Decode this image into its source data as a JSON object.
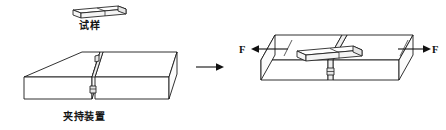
{
  "figure": {
    "type": "technical-line-diagram",
    "width": 446,
    "height": 130,
    "background_color": "#ffffff",
    "line_color": "#1a1a1a"
  },
  "labels": {
    "specimen": "试样",
    "clamping_device": "夹持装置",
    "force_left": "F",
    "force_right": "F"
  },
  "left_panel": {
    "name": "exploded-view",
    "parts": [
      {
        "id": "specimen-bar",
        "label": "试样"
      },
      {
        "id": "clamp-block-left",
        "label": ""
      },
      {
        "id": "clamp-block-right",
        "label": ""
      }
    ],
    "caption": "夹持装置"
  },
  "transition": {
    "name": "process-arrow",
    "direction": "right",
    "glyph": "→"
  },
  "right_panel": {
    "name": "assembled-view",
    "caption": "",
    "forces": [
      {
        "id": "force-left",
        "label": "F",
        "direction": "left"
      },
      {
        "id": "force-right",
        "label": "F",
        "direction": "right"
      }
    ]
  }
}
